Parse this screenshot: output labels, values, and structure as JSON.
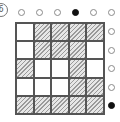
{
  "label": "6",
  "top_dots": [
    false,
    false,
    false,
    true,
    false,
    false
  ],
  "right_dots": [
    false,
    false,
    false,
    false,
    true
  ],
  "grid": [
    [
      0,
      1,
      1,
      1,
      1
    ],
    [
      0,
      1,
      1,
      1,
      0
    ],
    [
      1,
      0,
      0,
      1,
      0
    ],
    [
      0,
      0,
      0,
      1,
      1
    ],
    [
      1,
      1,
      1,
      1,
      1
    ]
  ],
  "colors": {
    "line": "#555555",
    "hatch": "#9a9a9a",
    "filled_dot": "#111111"
  }
}
